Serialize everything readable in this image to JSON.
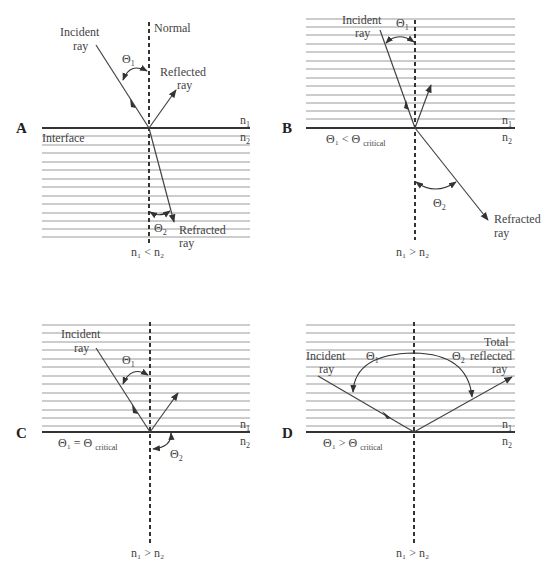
{
  "figure": {
    "panels": [
      {
        "id": "A",
        "letter": "A",
        "labels": {
          "incident_1": "Incident",
          "incident_2": "ray",
          "normal": "Normal",
          "theta1": "Θ",
          "theta1_sub": "1",
          "reflected_1": "Reflected",
          "reflected_2": "ray",
          "interface": "Interface",
          "n1": "n",
          "n1_sub": "1",
          "n2": "n",
          "n2_sub": "2",
          "theta2": "Θ",
          "theta2_sub": "2",
          "refracted_1": "Refracted",
          "refracted_2": "ray",
          "relation": "n₁ < n₂"
        },
        "hatched_medium": "n2 (below interface)"
      },
      {
        "id": "B",
        "letter": "B",
        "labels": {
          "incident_1": "Incident",
          "incident_2": "ray",
          "theta1": "Θ",
          "theta1_sub": "1",
          "n1": "n",
          "n1_sub": "1",
          "n2": "n",
          "n2_sub": "2",
          "condition": "Θ₁ < Θ",
          "condition_sub": "critical",
          "theta2": "Θ",
          "theta2_sub": "2",
          "refracted_1": "Refracted",
          "refracted_2": "ray",
          "relation": "n₁ > n₂"
        },
        "hatched_medium": "n1 (above interface)"
      },
      {
        "id": "C",
        "letter": "C",
        "labels": {
          "incident_1": "Incident",
          "incident_2": "ray",
          "theta1": "Θ",
          "theta1_sub": "1",
          "n1": "n",
          "n1_sub": "1",
          "n2": "n",
          "n2_sub": "2",
          "condition": "Θ₁ = Θ",
          "condition_sub": "critical",
          "theta2": "Θ",
          "theta2_sub": "2",
          "relation": "n₁ > n₂"
        },
        "hatched_medium": "n1 (above interface)"
      },
      {
        "id": "D",
        "letter": "D",
        "labels": {
          "incident_1": "Incident",
          "incident_2": "ray",
          "theta1": "Θ",
          "theta1_sub": "1",
          "theta2": "Θ",
          "theta2_sub": "2",
          "total_1": "Total",
          "total_2": "reflected",
          "total_3": "ray",
          "n1": "n",
          "n1_sub": "1",
          "n2": "n",
          "n2_sub": "2",
          "condition": "Θ₁ > Θ",
          "condition_sub": "critical",
          "relation": "n₁ > n₂"
        },
        "hatched_medium": "n1 (above interface)"
      }
    ],
    "colors": {
      "ink": "#333333",
      "hatch": "#9a9a9a",
      "background": "#ffffff"
    }
  }
}
